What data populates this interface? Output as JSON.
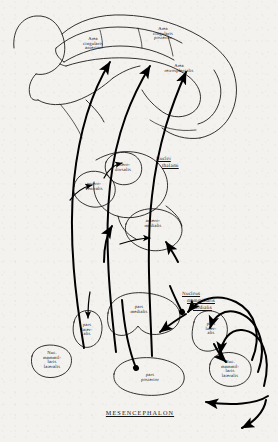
{
  "figure": {
    "title": "MESENCEPHALON",
    "caption": "MESENCEPHALON"
  },
  "cortex": {
    "areas": [
      {
        "id": "area-cingularis-anterior",
        "label": "Area\ncingularis\nanterior"
      },
      {
        "id": "area-cingularis-posterior",
        "label": "Area\ncingularis\nposterior"
      },
      {
        "id": "area-retrosplenialis",
        "label": "Area\nretrosplenialis"
      }
    ]
  },
  "thalamus": {
    "heading": "Nuclei\n  thalami",
    "heading_line1": "Nuclei",
    "heading_line2": "thalami",
    "nuclei": [
      {
        "id": "antero-dorsalis",
        "label": "antero-\ndorsalis"
      },
      {
        "id": "antero-ventralis",
        "label": "antero-\nventralis"
      },
      {
        "id": "antero-medialis",
        "label": "antero-\nmedialis"
      }
    ]
  },
  "mammillary": {
    "heading_line1": "Nucleus",
    "heading_line2": "mammillaris",
    "heading_line3": "medialis",
    "parts": [
      {
        "id": "pars-medialis",
        "label": "pars\nmedialis"
      },
      {
        "id": "pars-lateralis-left",
        "label": "pars\nlater-\nalis"
      },
      {
        "id": "pars-lateralis-right",
        "label": "pars\nlater-\nalis"
      },
      {
        "id": "pars-posterior",
        "label": "pars\nposterior"
      },
      {
        "id": "nuc-mammillaris-lateralis-left",
        "label": "Nuc.\nmammil-\nlaris\nlateralis"
      },
      {
        "id": "nuc-mammillaris-lateralis-right",
        "label": "Nuc.\nmammil-\nlaris\nlateralis"
      }
    ]
  },
  "colors": {
    "ink": "#111111",
    "tract": "#000000",
    "paper": "#f4f2ee"
  }
}
